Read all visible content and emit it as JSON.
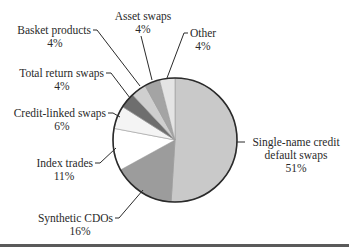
{
  "chart_data": {
    "type": "pie",
    "title": "",
    "start_angle_deg": 0,
    "direction": "clockwise",
    "slices": [
      {
        "label": "Single-name credit default swaps",
        "label_lines": [
          "Single-name credit",
          "default swaps"
        ],
        "value": 51,
        "pct_label": "51%",
        "color": "#c9c9c9"
      },
      {
        "label": "Synthetic CDOs",
        "label_lines": [
          "Synthetic CDOs"
        ],
        "value": 16,
        "pct_label": "16%",
        "color": "#9c9c9c"
      },
      {
        "label": "Index trades",
        "label_lines": [
          "Index trades"
        ],
        "value": 11,
        "pct_label": "11%",
        "color": "#ffffff"
      },
      {
        "label": "Credit-linked swaps",
        "label_lines": [
          "Credit-linked swaps"
        ],
        "value": 6,
        "pct_label": "6%",
        "color": "#f4f4f4"
      },
      {
        "label": "Total return swaps",
        "label_lines": [
          "Total return swaps"
        ],
        "value": 4,
        "pct_label": "4%",
        "color": "#6e6e6e"
      },
      {
        "label": "Basket products",
        "label_lines": [
          "Basket products"
        ],
        "value": 4,
        "pct_label": "4%",
        "color": "#cfcfcf"
      },
      {
        "label": "Asset swaps",
        "label_lines": [
          "Asset swaps"
        ],
        "value": 4,
        "pct_label": "4%",
        "color": "#a4a4a4"
      },
      {
        "label": "Other",
        "label_lines": [
          "Other"
        ],
        "value": 4,
        "pct_label": "4%",
        "color": "#e4e4e4"
      }
    ],
    "categories": [
      "Single-name credit default swaps",
      "Synthetic CDOs",
      "Index trades",
      "Credit-linked swaps",
      "Total return swaps",
      "Basket products",
      "Asset swaps",
      "Other"
    ],
    "values": [
      51,
      16,
      11,
      6,
      4,
      4,
      4,
      4
    ],
    "legend": "none (leader-line callouts)",
    "units": "%"
  },
  "labels": {
    "single_name_1": "Single-name credit",
    "single_name_2": "default swaps",
    "single_name_pct": "51%",
    "synthetic_cdos": "Synthetic CDOs",
    "synthetic_cdos_pct": "16%",
    "index_trades": "Index trades",
    "index_trades_pct": "11%",
    "credit_linked": "Credit-linked swaps",
    "credit_linked_pct": "6%",
    "total_return": "Total return swaps",
    "total_return_pct": "4%",
    "basket": "Basket products",
    "basket_pct": "4%",
    "asset_swaps": "Asset swaps",
    "asset_swaps_pct": "4%",
    "other": "Other",
    "other_pct": "4%"
  }
}
